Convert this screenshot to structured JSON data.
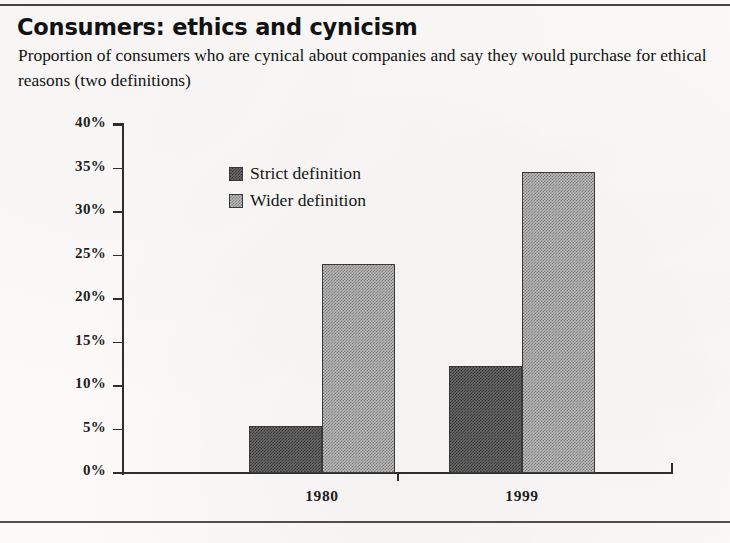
{
  "header": {
    "title": "Consumers: ethics and cynicism",
    "subtitle": "Proportion of consumers who are cynical about companies and say they would purchase for ethical reasons (two definitions)"
  },
  "chart_data": {
    "type": "bar",
    "title": "Consumers: ethics and cynicism",
    "subtitle": "Proportion of consumers who are cynical about companies and say they would purchase for ethical reasons (two definitions)",
    "categories": [
      "1980",
      "1999"
    ],
    "series": [
      {
        "name": "Strict definition",
        "values": [
          5.4,
          12.3
        ],
        "color": "#6a6a6a"
      },
      {
        "name": "Wider definition",
        "values": [
          24.0,
          34.6
        ],
        "color": "#bdbdbd"
      }
    ],
    "xlabel": "",
    "ylabel": "",
    "ylim": [
      0,
      40
    ],
    "yticks": [
      0,
      5,
      10,
      15,
      20,
      25,
      30,
      35,
      40
    ],
    "ytick_labels": [
      "0%",
      "5%",
      "10%",
      "15%",
      "20%",
      "25%",
      "30%",
      "35%",
      "40%"
    ],
    "value_suffix": "%",
    "grid": false,
    "legend_position": "inside-upper-center"
  }
}
